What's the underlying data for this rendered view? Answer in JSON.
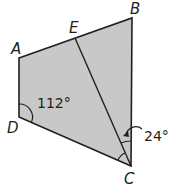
{
  "diagram": {
    "type": "geometry",
    "shape": "quadrilateral ABCD with segment EC",
    "fill_color": "#c8c8c8",
    "stroke_color": "#231f20",
    "vertices": {
      "A": {
        "label": "A",
        "x": 19,
        "y": 58
      },
      "B": {
        "label": "B",
        "x": 132,
        "y": 18
      },
      "C": {
        "label": "C",
        "x": 131,
        "y": 166
      },
      "D": {
        "label": "D",
        "x": 19,
        "y": 117
      },
      "E": {
        "label": "E",
        "x": 75,
        "y": 38
      }
    },
    "segments": [
      "AB",
      "BC",
      "CD",
      "DA",
      "EC"
    ],
    "angles": [
      {
        "vertex": "D",
        "label": "112°"
      },
      {
        "vertex": "C",
        "between": "EC, BC",
        "label": "24°"
      },
      {
        "vertex": "C",
        "between": "DC, EC",
        "label": ""
      }
    ]
  }
}
